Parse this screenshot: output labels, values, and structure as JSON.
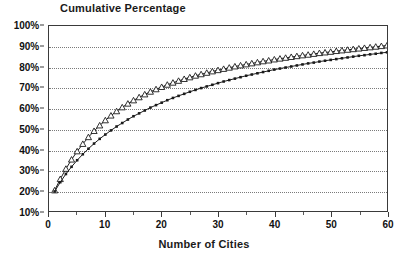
{
  "chart_data": {
    "type": "line",
    "title": "Cumulative Percentage",
    "xlabel": "Number of Cities",
    "ylabel": "",
    "xlim": [
      0,
      60
    ],
    "ylim": [
      10,
      100
    ],
    "grid": true,
    "legend_position": "none",
    "x_ticks": [
      0,
      10,
      20,
      30,
      40,
      50,
      60
    ],
    "x_tick_labels": [
      "0",
      "10",
      "20",
      "30",
      "40",
      "50",
      "60"
    ],
    "x_minor_ticks": [
      5,
      15,
      25,
      35,
      45,
      55
    ],
    "y_ticks": [
      10,
      20,
      30,
      40,
      50,
      60,
      70,
      80,
      90,
      100
    ],
    "y_tick_labels": [
      "10%",
      "20%",
      "30%",
      "40%",
      "50%",
      "60%",
      "70%",
      "80%",
      "90%",
      "100%"
    ],
    "x": [
      1,
      2,
      3,
      4,
      5,
      6,
      7,
      8,
      9,
      10,
      11,
      12,
      13,
      14,
      15,
      16,
      17,
      18,
      19,
      20,
      21,
      22,
      23,
      24,
      25,
      26,
      27,
      28,
      29,
      30,
      31,
      32,
      33,
      34,
      35,
      36,
      37,
      38,
      39,
      40,
      41,
      42,
      43,
      44,
      45,
      46,
      47,
      48,
      49,
      50,
      51,
      52,
      53,
      54,
      55,
      56,
      57,
      58,
      59,
      60
    ],
    "series": [
      {
        "name": "upper-series",
        "marker": "triangle",
        "values": [
          20.0,
          25.5,
          30.5,
          35.0,
          39.0,
          42.6,
          45.9,
          48.9,
          51.6,
          54.1,
          56.4,
          58.5,
          60.4,
          62.2,
          63.8,
          65.3,
          66.7,
          68.0,
          69.2,
          70.3,
          71.4,
          72.4,
          73.3,
          74.2,
          75.0,
          75.8,
          76.5,
          77.2,
          77.9,
          78.5,
          79.1,
          79.7,
          80.3,
          80.8,
          81.3,
          81.8,
          82.3,
          82.8,
          83.2,
          83.7,
          84.1,
          84.5,
          84.9,
          85.3,
          85.7,
          86.0,
          86.4,
          86.8,
          87.1,
          87.4,
          87.8,
          88.1,
          88.4,
          88.7,
          89.0,
          89.3,
          89.6,
          89.9,
          90.2,
          90.5
        ]
      },
      {
        "name": "lower-series",
        "marker": "square",
        "values": [
          19.5,
          24.0,
          28.0,
          31.5,
          34.7,
          37.6,
          40.3,
          42.8,
          45.1,
          47.2,
          49.2,
          51.1,
          52.8,
          54.5,
          56.1,
          57.5,
          58.9,
          60.3,
          61.5,
          62.7,
          63.9,
          65.0,
          66.0,
          67.0,
          68.0,
          68.9,
          69.8,
          70.6,
          71.4,
          72.2,
          73.0,
          73.7,
          74.4,
          75.1,
          75.8,
          76.4,
          77.0,
          77.6,
          78.2,
          78.8,
          79.3,
          79.8,
          80.3,
          80.8,
          81.3,
          81.8,
          82.2,
          82.7,
          83.1,
          83.5,
          83.9,
          84.3,
          84.7,
          85.1,
          85.5,
          85.8,
          86.2,
          86.5,
          86.9,
          87.2
        ]
      }
    ]
  },
  "colors": {
    "line": "#1a1a1a",
    "grid": "#7a7a7a",
    "frame": "#3a3a3a",
    "background": "#ffffff"
  }
}
